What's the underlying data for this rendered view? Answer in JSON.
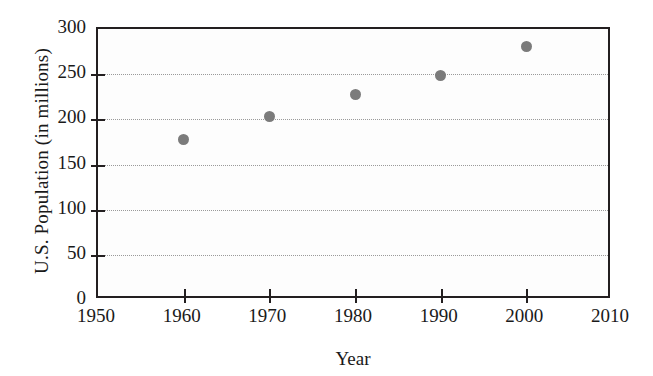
{
  "chart_data": {
    "type": "scatter",
    "title": "",
    "xlabel": "Year",
    "ylabel": "U.S. Population (in millions)",
    "x": [
      1960,
      1970,
      1980,
      1990,
      2000
    ],
    "values": [
      178,
      203,
      227,
      249,
      281
    ],
    "series": [
      {
        "name": "U.S. Population",
        "points": [
          {
            "x": 1960,
            "y": 178
          },
          {
            "x": 1970,
            "y": 203
          },
          {
            "x": 1980,
            "y": 227
          },
          {
            "x": 1990,
            "y": 249
          },
          {
            "x": 2000,
            "y": 281
          }
        ]
      }
    ],
    "xlim": [
      1950,
      2010
    ],
    "ylim": [
      0,
      300
    ],
    "xticks": [
      1950,
      1960,
      1970,
      1980,
      1990,
      2000,
      2010
    ],
    "xtick_labels": [
      "1950",
      "1960",
      "1970",
      "1980",
      "1990",
      "2000",
      "2010"
    ],
    "xtick_marks": [
      1960,
      1970,
      1980,
      1990,
      2000
    ],
    "yticks": [
      0,
      50,
      100,
      150,
      200,
      250,
      300
    ],
    "ytick_labels": [
      "0",
      "50",
      "100",
      "150",
      "200",
      "250",
      "300"
    ],
    "gridlines_y": [
      50,
      100,
      150,
      200,
      250
    ],
    "grid": true,
    "grid_style": "dotted",
    "legend": null,
    "marker_color": "#7b7b7b",
    "axis_color": "#231f20",
    "grid_color": "#9a9a9a",
    "plot_background": "#fdfdfd"
  }
}
